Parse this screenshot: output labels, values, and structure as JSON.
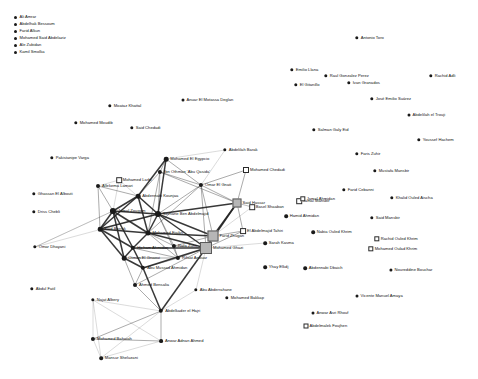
{
  "legend": {
    "items": [
      {
        "label": "Ali Amrar",
        "marker": "circle"
      },
      {
        "label": "Abdelhak Bessoum",
        "marker": "circle"
      },
      {
        "label": "Farid Alkun",
        "marker": "circle"
      },
      {
        "label": "Mohamed Said Abdelaziz",
        "marker": "circle"
      },
      {
        "label": "Ale Zubidan",
        "marker": "circle"
      },
      {
        "label": "Kamil Smolka",
        "marker": "circle"
      }
    ]
  },
  "graph": {
    "title": "",
    "nodes": [
      {
        "id": "n1",
        "label": "Antonio Toro",
        "x": 357,
        "y": 38,
        "shape": "circle",
        "size": 3.4
      },
      {
        "id": "n2",
        "label": "Emilio Llana",
        "x": 292,
        "y": 70,
        "shape": "circle",
        "size": 3.4
      },
      {
        "id": "n3",
        "label": "Raul Gonzalez Perez",
        "x": 326,
        "y": 76,
        "shape": "circle",
        "size": 3.4
      },
      {
        "id": "n4",
        "label": "Ivan Granados",
        "x": 349,
        "y": 83,
        "shape": "circle",
        "size": 3.4
      },
      {
        "id": "n5",
        "label": "El Gitanillo",
        "x": 296,
        "y": 85,
        "shape": "circle",
        "size": 3.4
      },
      {
        "id": "n6",
        "label": "Rachid Adli",
        "x": 431,
        "y": 76,
        "shape": "circle",
        "size": 3.4
      },
      {
        "id": "n7",
        "label": "José Emilio Suárez",
        "x": 372,
        "y": 99,
        "shape": "circle",
        "size": 3.4
      },
      {
        "id": "n8",
        "label": "Abdelilah el Trouji",
        "x": 409,
        "y": 115,
        "shape": "circle",
        "size": 3.0
      },
      {
        "id": "n9",
        "label": "Moataz Khattal",
        "x": 110,
        "y": 106,
        "shape": "circle",
        "size": 3.4
      },
      {
        "id": "n10",
        "label": "Anuar El Motassa Deglan",
        "x": 183,
        "y": 100,
        "shape": "circle",
        "size": 3.0
      },
      {
        "id": "n11",
        "label": "Mohamed Moudib",
        "x": 76,
        "y": 123,
        "shape": "circle",
        "size": 3.4
      },
      {
        "id": "n12",
        "label": "Said Chedadi",
        "x": 132,
        "y": 128,
        "shape": "circle",
        "size": 3.4
      },
      {
        "id": "n13",
        "label": "Salman Galy Eid",
        "x": 314,
        "y": 130,
        "shape": "circle",
        "size": 3.4
      },
      {
        "id": "n14",
        "label": "Youssef Hachem",
        "x": 419,
        "y": 140,
        "shape": "circle",
        "size": 3.4
      },
      {
        "id": "n15",
        "label": "Faris Zuhir",
        "x": 357,
        "y": 154,
        "shape": "circle",
        "size": 3.4
      },
      {
        "id": "n16",
        "label": "Pakistanipe Varga",
        "x": 52,
        "y": 158,
        "shape": "circle",
        "size": 3.4
      },
      {
        "id": "n17",
        "label": "Abdelilah Barak",
        "x": 225,
        "y": 150,
        "shape": "circle",
        "size": 3.4
      },
      {
        "id": "n18",
        "label": "Mohamed El Egypcio",
        "x": 166,
        "y": 159,
        "shape": "circle",
        "size": 4.6
      },
      {
        "id": "n19",
        "label": "Mustafa Mansbir",
        "x": 375,
        "y": 171,
        "shape": "circle",
        "size": 3.4
      },
      {
        "id": "n20",
        "label": "Mohamed Chedadi",
        "x": 246,
        "y": 170,
        "shape": "square-open",
        "size": 4.0
      },
      {
        "id": "n21",
        "label": "Ibn Othman 'Abu Qasida'",
        "x": 160,
        "y": 172,
        "shape": "circle",
        "size": 4.2
      },
      {
        "id": "n22",
        "label": "Mohamed Larbi",
        "x": 119,
        "y": 180,
        "shape": "square-open",
        "size": 3.6
      },
      {
        "id": "n23",
        "label": "Omar El Gnati",
        "x": 201,
        "y": 185,
        "shape": "circle",
        "size": 4.2
      },
      {
        "id": "n24",
        "label": "Ghassan El Albouti",
        "x": 34,
        "y": 194,
        "shape": "circle",
        "size": 3.4
      },
      {
        "id": "n25",
        "label": "Farid Cebanni",
        "x": 344,
        "y": 190,
        "shape": "circle",
        "size": 3.4
      },
      {
        "id": "n26",
        "label": "Khalid Ouled Aischa",
        "x": 392,
        "y": 198,
        "shape": "circle",
        "size": 3.4
      },
      {
        "id": "n27",
        "label": "Said Hassar",
        "x": 237,
        "y": 203,
        "shape": "square-fill",
        "size": 7.0
      },
      {
        "id": "n28",
        "label": "Jamal Mansbir",
        "x": 299,
        "y": 201,
        "shape": "square-open",
        "size": 3.6
      },
      {
        "id": "n29",
        "label": "Basel Shaaban",
        "x": 252,
        "y": 207,
        "shape": "square-open",
        "size": 3.6
      },
      {
        "id": "n30",
        "label": "Driss Chebli",
        "x": 34,
        "y": 212,
        "shape": "circle",
        "size": 3.4
      },
      {
        "id": "n31",
        "label": "Jamal Ahmidan",
        "x": 303,
        "y": 199,
        "shape": "square-open",
        "size": 3.4
      },
      {
        "id": "n32",
        "label": "Said Mansbir",
        "x": 372,
        "y": 218,
        "shape": "circle",
        "size": 3.4
      },
      {
        "id": "n33",
        "label": "Hamid Ahmidan",
        "x": 286,
        "y": 216,
        "shape": "circle",
        "size": 3.6
      },
      {
        "id": "n34",
        "label": "Jamal Zougam",
        "x": 113,
        "y": 211,
        "shape": "circle",
        "size": 6.2
      },
      {
        "id": "n35",
        "label": "Serhane Ben Abdelmajid",
        "x": 158,
        "y": 214,
        "shape": "circle",
        "size": 6.0
      },
      {
        "id": "n36",
        "label": "El Abdelmajid Tahiri",
        "x": 243,
        "y": 231,
        "shape": "square-open",
        "size": 3.8
      },
      {
        "id": "n37",
        "label": "Nabia Ouled Khrim",
        "x": 313,
        "y": 232,
        "shape": "circle",
        "size": 3.6
      },
      {
        "id": "n38",
        "label": "Farid Zhugan",
        "x": 213,
        "y": 236,
        "shape": "square-fill",
        "size": 9.0
      },
      {
        "id": "n39",
        "label": "Sarah Kasma",
        "x": 265,
        "y": 243,
        "shape": "circle",
        "size": 3.6
      },
      {
        "id": "n40",
        "label": "Omar Dhayani",
        "x": 35,
        "y": 247,
        "shape": "circle",
        "size": 3.4
      },
      {
        "id": "n41",
        "label": "Mohamed Ghazi",
        "x": 206,
        "y": 248,
        "shape": "square-fill",
        "size": 10.0
      },
      {
        "id": "n42",
        "label": "Rachid Ouled Khrim",
        "x": 377,
        "y": 239,
        "shape": "square-open",
        "size": 3.4
      },
      {
        "id": "n43",
        "label": "Mohamed Oulad Khrim",
        "x": 371,
        "y": 249,
        "shape": "square-open",
        "size": 3.4
      },
      {
        "id": "n44",
        "label": "Yhay Elkdj",
        "x": 265,
        "y": 267,
        "shape": "circle",
        "size": 3.6
      },
      {
        "id": "n45",
        "label": "Abdennabi Dbaich",
        "x": 305,
        "y": 268,
        "shape": "circle",
        "size": 3.6
      },
      {
        "id": "n46",
        "label": "Noureddine Bouchar",
        "x": 391,
        "y": 270,
        "shape": "circle",
        "size": 3.2
      },
      {
        "id": "n47",
        "label": "Abu Mussad Ahmidan",
        "x": 143,
        "y": 268,
        "shape": "circle",
        "size": 4.4
      },
      {
        "id": "n48",
        "label": "Ahmed Bensalia",
        "x": 135,
        "y": 285,
        "shape": "circle",
        "size": 4.0
      },
      {
        "id": "n49",
        "label": "Abdul Fatil",
        "x": 32,
        "y": 289,
        "shape": "circle",
        "size": 3.4
      },
      {
        "id": "n50",
        "label": "Najat Albery",
        "x": 93,
        "y": 300,
        "shape": "circle",
        "size": 3.4
      },
      {
        "id": "n51",
        "label": "Abu Abderrahane",
        "x": 196,
        "y": 290,
        "shape": "circle",
        "size": 3.4
      },
      {
        "id": "n52",
        "label": "Mohamed Bakkap",
        "x": 227,
        "y": 298,
        "shape": "circle",
        "size": 3.4
      },
      {
        "id": "n53",
        "label": "Vicente Manuel Amaya",
        "x": 357,
        "y": 296,
        "shape": "circle",
        "size": 3.0
      },
      {
        "id": "n54",
        "label": "Abdelkader el Hajri",
        "x": 161,
        "y": 311,
        "shape": "circle",
        "size": 4.4
      },
      {
        "id": "n55",
        "label": "Anwar Asri Rhouf",
        "x": 313,
        "y": 313,
        "shape": "circle",
        "size": 3.0
      },
      {
        "id": "n56",
        "label": "Abdelmalek Foujhen",
        "x": 306,
        "y": 326,
        "shape": "square-open",
        "size": 3.0
      },
      {
        "id": "n57",
        "label": "Mohamed Bahaiah",
        "x": 93,
        "y": 339,
        "shape": "circle",
        "size": 4.2
      },
      {
        "id": "n58",
        "label": "Anwar Adnan Ahmed",
        "x": 161,
        "y": 341,
        "shape": "circle",
        "size": 3.8
      },
      {
        "id": "n59",
        "label": "Mansur Sheluzani",
        "x": 101,
        "y": 358,
        "shape": "circle",
        "size": 3.6
      },
      {
        "id": "n60",
        "label": "Mohamed Fisikri",
        "x": 148,
        "y": 233,
        "shape": "circle",
        "size": 5.0
      },
      {
        "id": "n61",
        "label": "Said Berrak",
        "x": 100,
        "y": 229,
        "shape": "circle",
        "size": 4.6
      },
      {
        "id": "n62",
        "label": "Hicham Ahmidan",
        "x": 133,
        "y": 248,
        "shape": "circle",
        "size": 4.4
      },
      {
        "id": "n63",
        "label": "Rafa Zuhir",
        "x": 174,
        "y": 246,
        "shape": "circle",
        "size": 4.2
      },
      {
        "id": "n64",
        "label": "Otman El Gnaoui",
        "x": 124,
        "y": 258,
        "shape": "circle",
        "size": 4.6
      },
      {
        "id": "n65",
        "label": "Rifaat Anouar",
        "x": 178,
        "y": 258,
        "shape": "circle",
        "size": 4.2
      },
      {
        "id": "n66",
        "label": "Abdennabi Kounjaa",
        "x": 138,
        "y": 196,
        "shape": "circle",
        "size": 4.6
      },
      {
        "id": "n67",
        "label": "Allekema Lamari",
        "x": 98,
        "y": 186,
        "shape": "circle",
        "size": 4.0
      }
    ],
    "edges": [
      [
        "n18",
        "n21"
      ],
      [
        "n18",
        "n23"
      ],
      [
        "n18",
        "n66"
      ],
      [
        "n18",
        "n17"
      ],
      [
        "n18",
        "n35"
      ],
      [
        "n21",
        "n23"
      ],
      [
        "n21",
        "n66"
      ],
      [
        "n21",
        "n35"
      ],
      [
        "n21",
        "n60"
      ],
      [
        "n21",
        "n27"
      ],
      [
        "n23",
        "n27"
      ],
      [
        "n23",
        "n38"
      ],
      [
        "n23",
        "n41"
      ],
      [
        "n23",
        "n35"
      ],
      [
        "n23",
        "n60"
      ],
      [
        "n66",
        "n67"
      ],
      [
        "n66",
        "n61"
      ],
      [
        "n66",
        "n35"
      ],
      [
        "n66",
        "n60"
      ],
      [
        "n66",
        "n34"
      ],
      [
        "n67",
        "n22"
      ],
      [
        "n67",
        "n34"
      ],
      [
        "n67",
        "n61"
      ],
      [
        "n34",
        "n61"
      ],
      [
        "n34",
        "n60"
      ],
      [
        "n34",
        "n64"
      ],
      [
        "n34",
        "n62"
      ],
      [
        "n34",
        "n35"
      ],
      [
        "n34",
        "n40"
      ],
      [
        "n61",
        "n60"
      ],
      [
        "n61",
        "n62"
      ],
      [
        "n61",
        "n64"
      ],
      [
        "n61",
        "n35"
      ],
      [
        "n35",
        "n60"
      ],
      [
        "n35",
        "n63"
      ],
      [
        "n35",
        "n65"
      ],
      [
        "n35",
        "n41"
      ],
      [
        "n35",
        "n38"
      ],
      [
        "n35",
        "n27"
      ],
      [
        "n60",
        "n63"
      ],
      [
        "n60",
        "n65"
      ],
      [
        "n60",
        "n62"
      ],
      [
        "n60",
        "n41"
      ],
      [
        "n60",
        "n38"
      ],
      [
        "n62",
        "n64"
      ],
      [
        "n62",
        "n65"
      ],
      [
        "n62",
        "n47"
      ],
      [
        "n62",
        "n41"
      ],
      [
        "n64",
        "n65"
      ],
      [
        "n64",
        "n47"
      ],
      [
        "n64",
        "n48"
      ],
      [
        "n63",
        "n65"
      ],
      [
        "n63",
        "n41"
      ],
      [
        "n63",
        "n38"
      ],
      [
        "n65",
        "n41"
      ],
      [
        "n65",
        "n47"
      ],
      [
        "n47",
        "n48"
      ],
      [
        "n47",
        "n41"
      ],
      [
        "n47",
        "n54"
      ],
      [
        "n48",
        "n54"
      ],
      [
        "n48",
        "n41"
      ],
      [
        "n27",
        "n38"
      ],
      [
        "n27",
        "n41"
      ],
      [
        "n27",
        "n20"
      ],
      [
        "n27",
        "n29"
      ],
      [
        "n38",
        "n41"
      ],
      [
        "n38",
        "n36"
      ],
      [
        "n38",
        "n29"
      ],
      [
        "n41",
        "n51"
      ],
      [
        "n41",
        "n36"
      ],
      [
        "n41",
        "n39"
      ],
      [
        "n54",
        "n50"
      ],
      [
        "n54",
        "n57"
      ],
      [
        "n54",
        "n58"
      ],
      [
        "n54",
        "n59"
      ],
      [
        "n54",
        "n51"
      ],
      [
        "n54",
        "n41"
      ],
      [
        "n50",
        "n57"
      ],
      [
        "n50",
        "n58"
      ],
      [
        "n50",
        "n59"
      ],
      [
        "n57",
        "n58"
      ],
      [
        "n57",
        "n59"
      ],
      [
        "n58",
        "n59"
      ],
      [
        "n40",
        "n35"
      ],
      [
        "n40",
        "n34"
      ],
      [
        "n22",
        "n35"
      ],
      [
        "n22",
        "n34"
      ],
      [
        "n17",
        "n23"
      ],
      [
        "n20",
        "n23"
      ],
      [
        "n29",
        "n27"
      ],
      [
        "n36",
        "n27"
      ]
    ]
  }
}
